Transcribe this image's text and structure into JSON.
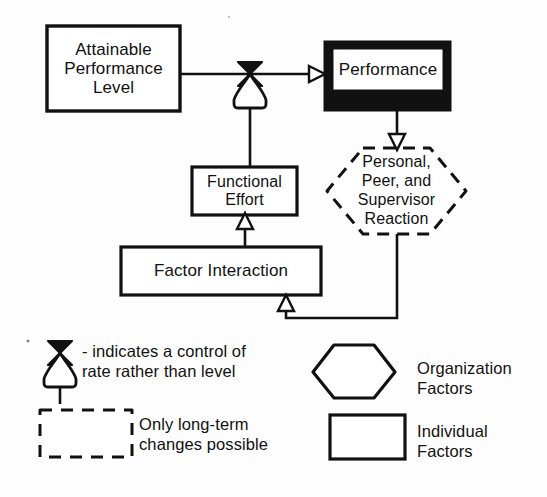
{
  "diagram": {
    "background_color": "#fdfdfd",
    "ink_color": "#111111",
    "nodes": {
      "attainable": {
        "label": "Attainable\nPerformance\nLevel",
        "shape": "rectangle",
        "category": "Individual Factors"
      },
      "performance": {
        "label": "Performance",
        "shape": "thick-bordered-rectangle",
        "category": "Individual Factors",
        "emphasis": "heavy black border"
      },
      "reaction": {
        "label": "Personal,\nPeer, and\nSupervisor\nReaction",
        "shape": "dashed-hexagon",
        "category": "Organization Factors"
      },
      "functional_effort": {
        "label": "Functional\nEffort",
        "shape": "rectangle",
        "category": "Individual Factors"
      },
      "factor_interaction": {
        "label": "Factor Interaction",
        "shape": "rectangle",
        "category": "Individual Factors"
      }
    },
    "valve": {
      "name": "rate-control-valve",
      "description": "control of rate rather than level"
    }
  },
  "legend": {
    "valve_note": "- indicates a control of\n   rate rather than level",
    "dashed_note": "Only long-term\nchanges possible",
    "hexagon_note": "Organization\nFactors",
    "rectangle_note": "Individual\nFactors"
  }
}
